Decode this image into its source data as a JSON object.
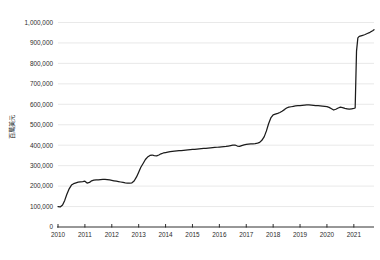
{
  "chart_data": {
    "type": "line",
    "title": "",
    "subtitle": "",
    "xlabel": "",
    "ylabel": "百萬美元",
    "ylim": [
      0,
      1000000
    ],
    "xlim": [
      2010.0,
      2021.75
    ],
    "grid": true,
    "legend": false,
    "legend_position": "none",
    "line_color": "#1b1b1b",
    "grid_color": "#e3e3e3",
    "axis_color": "#1a1a1a",
    "background_color": "#ffffff",
    "y_ticks": [
      0,
      100000,
      200000,
      300000,
      400000,
      500000,
      600000,
      700000,
      800000,
      900000,
      1000000
    ],
    "y_tick_labels": [
      "0",
      "100,000",
      "200,000",
      "300,000",
      "400,000",
      "500,000",
      "600,000",
      "700,000",
      "800,000",
      "900,000",
      "1,000,000"
    ],
    "x_ticks": [
      2010,
      2011,
      2012,
      2013,
      2014,
      2015,
      2016,
      2017,
      2018,
      2019,
      2020,
      2021
    ],
    "x_tick_labels": [
      "2010",
      "2011",
      "2012",
      "2013",
      "2014",
      "2015",
      "2016",
      "2017",
      "2018",
      "2019",
      "2020",
      "2021"
    ],
    "series": [
      {
        "name": "series-1",
        "x": [
          2010.0,
          2010.08,
          2010.17,
          2010.25,
          2010.33,
          2010.42,
          2010.5,
          2010.58,
          2010.67,
          2010.75,
          2010.83,
          2010.92,
          2011.0,
          2011.08,
          2011.17,
          2011.25,
          2011.33,
          2011.42,
          2011.5,
          2011.58,
          2011.67,
          2011.75,
          2011.83,
          2011.92,
          2012.0,
          2012.08,
          2012.17,
          2012.25,
          2012.33,
          2012.42,
          2012.5,
          2012.58,
          2012.67,
          2012.75,
          2012.83,
          2012.92,
          2013.0,
          2013.08,
          2013.17,
          2013.25,
          2013.33,
          2013.42,
          2013.5,
          2013.58,
          2013.67,
          2013.75,
          2013.83,
          2013.92,
          2014.0,
          2014.08,
          2014.17,
          2014.25,
          2014.33,
          2014.42,
          2014.5,
          2014.58,
          2014.67,
          2014.75,
          2014.83,
          2014.92,
          2015.0,
          2015.08,
          2015.17,
          2015.25,
          2015.33,
          2015.42,
          2015.5,
          2015.58,
          2015.67,
          2015.75,
          2015.83,
          2015.92,
          2016.0,
          2016.08,
          2016.17,
          2016.25,
          2016.33,
          2016.42,
          2016.5,
          2016.58,
          2016.67,
          2016.75,
          2016.83,
          2016.92,
          2017.0,
          2017.08,
          2017.17,
          2017.25,
          2017.33,
          2017.42,
          2017.5,
          2017.58,
          2017.67,
          2017.75,
          2017.83,
          2017.92,
          2018.0,
          2018.08,
          2018.17,
          2018.25,
          2018.33,
          2018.42,
          2018.5,
          2018.58,
          2018.67,
          2018.75,
          2018.83,
          2018.92,
          2019.0,
          2019.08,
          2019.17,
          2019.25,
          2019.33,
          2019.42,
          2019.5,
          2019.58,
          2019.67,
          2019.75,
          2019.83,
          2019.92,
          2020.0,
          2020.08,
          2020.17,
          2020.25,
          2020.33,
          2020.42,
          2020.5,
          2020.58,
          2020.67,
          2020.75,
          2020.83,
          2020.92,
          2021.0,
          2021.05,
          2021.1,
          2021.15,
          2021.2,
          2021.3,
          2021.4,
          2021.5,
          2021.6,
          2021.7,
          2021.75
        ],
        "y": [
          100000,
          98000,
          108000,
          130000,
          160000,
          188000,
          205000,
          212000,
          216000,
          219000,
          221000,
          222000,
          224000,
          215000,
          218000,
          226000,
          229000,
          230000,
          231000,
          232000,
          233000,
          233000,
          232000,
          230000,
          228000,
          226000,
          224000,
          222000,
          220000,
          218000,
          216000,
          215000,
          214000,
          216000,
          225000,
          245000,
          268000,
          292000,
          312000,
          330000,
          342000,
          350000,
          352000,
          349000,
          348000,
          352000,
          358000,
          362000,
          364000,
          366000,
          368000,
          370000,
          371000,
          372000,
          373000,
          374000,
          375000,
          376000,
          377000,
          378000,
          379000,
          380000,
          381000,
          382000,
          383000,
          384000,
          385000,
          386000,
          387000,
          388000,
          389000,
          390000,
          391000,
          392000,
          393000,
          394000,
          396000,
          398000,
          400000,
          401000,
          396000,
          394000,
          398000,
          402000,
          404000,
          405000,
          406000,
          407000,
          408000,
          410000,
          414000,
          424000,
          442000,
          470000,
          505000,
          535000,
          548000,
          552000,
          556000,
          560000,
          566000,
          574000,
          582000,
          586000,
          588000,
          590000,
          592000,
          593000,
          594000,
          595000,
          596000,
          597000,
          597000,
          596000,
          595000,
          594000,
          593000,
          592000,
          591000,
          590000,
          589000,
          585000,
          578000,
          572000,
          576000,
          582000,
          586000,
          584000,
          580000,
          578000,
          576000,
          578000,
          580000,
          582000,
          860000,
          925000,
          932000,
          936000,
          940000,
          946000,
          952000,
          960000,
          965000
        ]
      }
    ]
  },
  "axis": {
    "y_label": "百萬美元",
    "zero_label": "0"
  }
}
